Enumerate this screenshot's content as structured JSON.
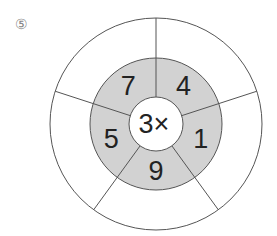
{
  "problem_label": "⑤",
  "center_text": "3×",
  "ring_numbers": [
    "4",
    "1",
    "9",
    "5",
    "7"
  ],
  "colors": {
    "ring_fill": "#d2d2d2",
    "line": "#555555",
    "background": "#ffffff"
  },
  "outer_answers": [
    "",
    "",
    "",
    "",
    ""
  ]
}
